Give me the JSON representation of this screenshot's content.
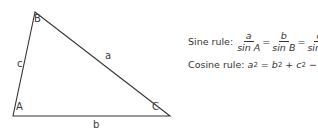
{
  "triangle": {
    "vertices": {
      "A": {
        "label": "A",
        "x": 13,
        "y": 116
      },
      "B": {
        "label": "B",
        "x": 35,
        "y": 12
      },
      "C": {
        "label": "C",
        "x": 170,
        "y": 116
      }
    },
    "sides": {
      "a": "a",
      "b": "b",
      "c": "c"
    },
    "stroke_color": "#333333"
  },
  "sine_rule": {
    "label": "Sine rule:",
    "fractions": [
      {
        "num": "a",
        "den": "sin A"
      },
      {
        "num": "b",
        "den": "sin B"
      },
      {
        "num": "c",
        "den": "sin C"
      }
    ],
    "equals": "="
  },
  "cosine_rule": {
    "label": "Cosine rule:",
    "lhs": "a",
    "eq": " = ",
    "t1": "b",
    "plus": " + ",
    "t2": "c",
    "minus": " − ",
    "t3": "2bc",
    "t4": " cos ",
    "t5": "A",
    "exp": "2"
  }
}
